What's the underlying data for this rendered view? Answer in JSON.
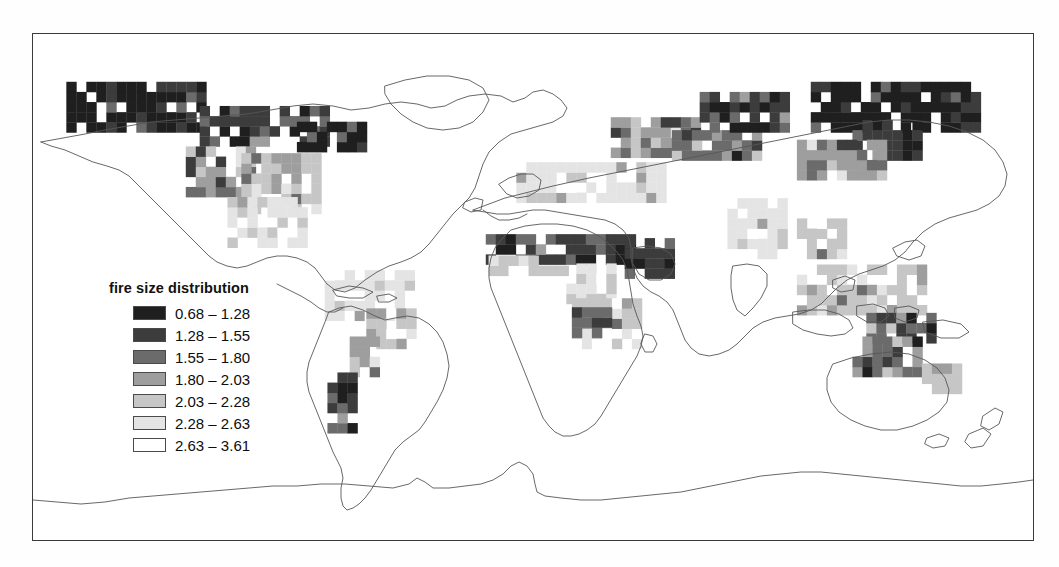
{
  "figure": {
    "frame_visible": true,
    "background_color": "#ffffff",
    "border_color": "#3a3a3a"
  },
  "legend": {
    "title": "fire size distribution",
    "classes": [
      {
        "label": "0.68 – 1.28",
        "range_low": 0.68,
        "range_high": 1.28,
        "color": "#1f1f1f"
      },
      {
        "label": "1.28 – 1.55",
        "range_low": 1.28,
        "range_high": 1.55,
        "color": "#3c3c3c"
      },
      {
        "label": "1.55 – 1.80",
        "range_low": 1.55,
        "range_high": 1.8,
        "color": "#6b6b6b"
      },
      {
        "label": "1.80 – 2.03",
        "range_low": 1.8,
        "range_high": 2.03,
        "color": "#9e9e9e"
      },
      {
        "label": "2.03 – 2.28",
        "range_low": 2.03,
        "range_high": 2.28,
        "color": "#c6c6c6"
      },
      {
        "label": "2.28 – 2.63",
        "range_low": 2.28,
        "range_high": 2.63,
        "color": "#e4e4e4"
      },
      {
        "label": "2.63 – 3.61",
        "range_low": 2.63,
        "range_high": 3.61,
        "color": "#ffffff"
      }
    ]
  },
  "chart_data": {
    "type": "heatmap",
    "title": "fire size distribution",
    "subtitle": "",
    "xlabel": "",
    "ylabel": "",
    "projection": "equirectangular",
    "grid": false,
    "legend_position": "inner-left",
    "xlim": [
      -180,
      180
    ],
    "ylim": [
      -90,
      90
    ],
    "cell_size_deg": 3.6,
    "value_name": "fire size distribution (Pareto exponent)",
    "value_range": [
      0.68,
      3.61
    ],
    "class_breaks": [
      0.68,
      1.28,
      1.55,
      1.8,
      2.03,
      2.28,
      2.63,
      3.61
    ],
    "class_colors": [
      "#1f1f1f",
      "#3c3c3c",
      "#6b6b6b",
      "#9e9e9e",
      "#c6c6c6",
      "#e4e4e4",
      "#ffffff"
    ],
    "coastlines": true,
    "country_borders": true,
    "regions": [
      {
        "name": "Boreal Alaska / NW Canada",
        "lon_range": [
          -168,
          -120
        ],
        "lat_range": [
          55,
          70
        ],
        "dominant_class": 0,
        "note": "very dark, largest fires"
      },
      {
        "name": "Boreal central Canada",
        "lon_range": [
          -120,
          -75
        ],
        "lat_range": [
          50,
          62
        ],
        "dominant_class": 1,
        "note": "dark"
      },
      {
        "name": "Eastern Canada / Quebec",
        "lon_range": [
          -85,
          -60
        ],
        "lat_range": [
          48,
          58
        ],
        "dominant_class": 0,
        "note": "dark patch"
      },
      {
        "name": "Western United States",
        "lon_range": [
          -125,
          -100
        ],
        "lat_range": [
          32,
          49
        ],
        "dominant_class": 3,
        "note": "mixed mid-gray with dark cells"
      },
      {
        "name": "Great Plains / SE United States",
        "lon_range": [
          -105,
          -78
        ],
        "lat_range": [
          26,
          45
        ],
        "dominant_class": 4,
        "note": "light with scattered dark"
      },
      {
        "name": "Mexico / Central America",
        "lon_range": [
          -110,
          -84
        ],
        "lat_range": [
          14,
          30
        ],
        "dominant_class": 5,
        "note": "light"
      },
      {
        "name": "Amazon basin",
        "lon_range": [
          -75,
          -45
        ],
        "lat_range": [
          -12,
          5
        ],
        "dominant_class": 5,
        "note": "very light"
      },
      {
        "name": "Cerrado / Brazil interior",
        "lon_range": [
          -60,
          -42
        ],
        "lat_range": [
          -22,
          -8
        ],
        "dominant_class": 4,
        "note": "light gray"
      },
      {
        "name": "Gran Chaco / N Argentina",
        "lon_range": [
          -66,
          -56
        ],
        "lat_range": [
          -32,
          -20
        ],
        "dominant_class": 3,
        "note": "mid gray with dark cells"
      },
      {
        "name": "Patagonia / Andes",
        "lon_range": [
          -74,
          -65
        ],
        "lat_range": [
          -52,
          -32
        ],
        "dominant_class": 1,
        "note": "dark narrow strip"
      },
      {
        "name": "Sahel belt",
        "lon_range": [
          -17,
          40
        ],
        "lat_range": [
          8,
          16
        ],
        "dominant_class": 1,
        "note": "dark continuous band"
      },
      {
        "name": "Guinea / West Africa coast",
        "lon_range": [
          -16,
          10
        ],
        "lat_range": [
          4,
          11
        ],
        "dominant_class": 4,
        "note": "light"
      },
      {
        "name": "Congo basin",
        "lon_range": [
          12,
          30
        ],
        "lat_range": [
          -6,
          5
        ],
        "dominant_class": 5,
        "note": "very light / white holes"
      },
      {
        "name": "Southern Africa savanna",
        "lon_range": [
          14,
          36
        ],
        "lat_range": [
          -22,
          -6
        ],
        "dominant_class": 4,
        "note": "light gray"
      },
      {
        "name": "Angola / Zambia fire belt",
        "lon_range": [
          14,
          26
        ],
        "lat_range": [
          -18,
          -10
        ],
        "dominant_class": 2,
        "note": "dark grey patch"
      },
      {
        "name": "Ethiopia / Horn of Africa",
        "lon_range": [
          33,
          48
        ],
        "lat_range": [
          3,
          14
        ],
        "dominant_class": 1,
        "note": "dark"
      },
      {
        "name": "North Africa / Sahara",
        "lon_range": [
          -10,
          32
        ],
        "lat_range": [
          18,
          32
        ],
        "dominant_class": 6,
        "note": "no data / white"
      },
      {
        "name": "Mediterranean / Middle East",
        "lon_range": [
          -6,
          45
        ],
        "lat_range": [
          30,
          42
        ],
        "dominant_class": 5,
        "note": "sparse light"
      },
      {
        "name": "European Russia / Ukraine steppe",
        "lon_range": [
          28,
          60
        ],
        "lat_range": [
          46,
          58
        ],
        "dominant_class": 3,
        "note": "mid gray band"
      },
      {
        "name": "Kazakhstan steppe",
        "lon_range": [
          50,
          80
        ],
        "lat_range": [
          45,
          55
        ],
        "dominant_class": 2,
        "note": "dark band"
      },
      {
        "name": "West Siberia",
        "lon_range": [
          60,
          90
        ],
        "lat_range": [
          55,
          68
        ],
        "dominant_class": 1,
        "note": "dark"
      },
      {
        "name": "East Siberia / Yakutia",
        "lon_range": [
          100,
          160
        ],
        "lat_range": [
          55,
          70
        ],
        "dominant_class": 0,
        "note": "very dark, densest"
      },
      {
        "name": "Russian Far East / Amur",
        "lon_range": [
          115,
          140
        ],
        "lat_range": [
          45,
          56
        ],
        "dominant_class": 1,
        "note": "dark"
      },
      {
        "name": "Mongolia / N China",
        "lon_range": [
          95,
          125
        ],
        "lat_range": [
          38,
          50
        ],
        "dominant_class": 3,
        "note": "mixed"
      },
      {
        "name": "India",
        "lon_range": [
          70,
          88
        ],
        "lat_range": [
          10,
          30
        ],
        "dominant_class": 5,
        "note": "very light"
      },
      {
        "name": "Indochina",
        "lon_range": [
          95,
          110
        ],
        "lat_range": [
          10,
          24
        ],
        "dominant_class": 4,
        "note": "light"
      },
      {
        "name": "Maritime SE Asia / Indonesia",
        "lon_range": [
          95,
          140
        ],
        "lat_range": [
          -10,
          8
        ],
        "dominant_class": 4,
        "note": "light with dark cells"
      },
      {
        "name": "Northern Australia",
        "lon_range": [
          120,
          145
        ],
        "lat_range": [
          -20,
          -11
        ],
        "dominant_class": 2,
        "note": "dark grey"
      },
      {
        "name": "Central / Western Australia",
        "lon_range": [
          115,
          140
        ],
        "lat_range": [
          -32,
          -20
        ],
        "dominant_class": 2,
        "note": "dark grey interior"
      },
      {
        "name": "SE Australia",
        "lon_range": [
          140,
          153
        ],
        "lat_range": [
          -38,
          -28
        ],
        "dominant_class": 4,
        "note": "light"
      },
      {
        "name": "Antarctica",
        "lon_range": [
          -180,
          180
        ],
        "lat_range": [
          -90,
          -62
        ],
        "dominant_class": 6,
        "note": "no data"
      }
    ]
  }
}
